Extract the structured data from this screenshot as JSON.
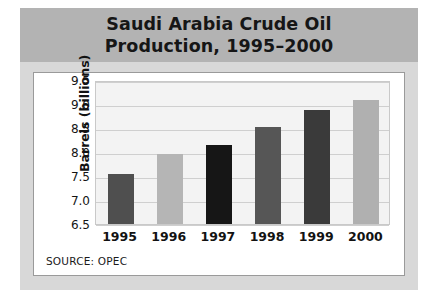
{
  "title": {
    "line1": "Saudi Arabia Crude Oil",
    "line2": "Production, 1995–2000"
  },
  "source_note": "SOURCE: OPEC",
  "chart_data": {
    "type": "bar",
    "title": "Saudi Arabia Crude Oil Production, 1995–2000",
    "xlabel": "",
    "ylabel": "Barrels (billions)",
    "categories": [
      "1995",
      "1996",
      "1997",
      "1998",
      "1999",
      "2000"
    ],
    "values": [
      7.55,
      7.95,
      8.15,
      8.52,
      8.88,
      9.08
    ],
    "ylim": [
      6.5,
      9.5
    ],
    "ytick_labels": [
      "9.5",
      "9.0",
      "8.5",
      "8.0",
      "7.5",
      "7.0",
      "6.5"
    ],
    "ytick_values": [
      9.5,
      9.0,
      8.5,
      8.0,
      7.5,
      7.0,
      6.5
    ],
    "grid": true,
    "legend": "none",
    "bar_colors": [
      "#4f4f4f",
      "#b5b5b5",
      "#161616",
      "#565656",
      "#3a3a3a",
      "#b0b0b0"
    ],
    "plot_background": "#f3f3f3",
    "header_background": "#b3b3b3",
    "panel_background": "#d8d8d8"
  }
}
